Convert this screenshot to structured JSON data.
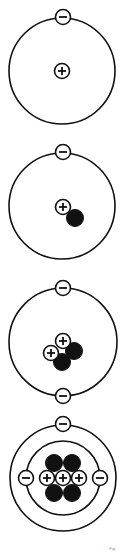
{
  "diagram": {
    "title": "",
    "colors": {
      "stroke": "#111111",
      "background": "#ffffff",
      "neutron": "#111111"
    },
    "particle_radius": 7.5,
    "neutron_radius": 8.5,
    "atoms": [
      {
        "name": "atom-1",
        "orbits": [
          {
            "cx": 62,
            "cy": 71,
            "r": 53
          }
        ],
        "electrons": [
          {
            "cx": 63,
            "cy": 17
          }
        ],
        "neutrons": [],
        "protons": [
          {
            "cx": 62,
            "cy": 71
          }
        ]
      },
      {
        "name": "atom-2",
        "orbits": [
          {
            "cx": 62,
            "cy": 206,
            "r": 53
          }
        ],
        "electrons": [
          {
            "cx": 63,
            "cy": 152
          }
        ],
        "neutrons": [
          {
            "cx": 75,
            "cy": 218
          }
        ],
        "protons": [
          {
            "cx": 63,
            "cy": 207
          }
        ]
      },
      {
        "name": "atom-3",
        "orbits": [
          {
            "cx": 63,
            "cy": 342,
            "r": 54
          }
        ],
        "electrons": [
          {
            "cx": 63,
            "cy": 288
          },
          {
            "cx": 63,
            "cy": 396
          }
        ],
        "neutrons": [
          {
            "cx": 74,
            "cy": 351
          },
          {
            "cx": 62,
            "cy": 362
          }
        ],
        "protons": [
          {
            "cx": 63,
            "cy": 341
          },
          {
            "cx": 51,
            "cy": 353
          }
        ]
      },
      {
        "name": "atom-4",
        "orbits": [
          {
            "cx": 63,
            "cy": 478,
            "r": 53
          },
          {
            "cx": 63,
            "cy": 478,
            "r": 37
          }
        ],
        "electrons": [
          {
            "cx": 63,
            "cy": 424
          },
          {
            "cx": 26,
            "cy": 478
          },
          {
            "cx": 100,
            "cy": 478
          }
        ],
        "neutrons": [
          {
            "cx": 54,
            "cy": 463
          },
          {
            "cx": 72,
            "cy": 463
          },
          {
            "cx": 54,
            "cy": 493
          },
          {
            "cx": 72,
            "cy": 493
          }
        ],
        "protons": [
          {
            "cx": 47,
            "cy": 478
          },
          {
            "cx": 63,
            "cy": 478
          },
          {
            "cx": 79,
            "cy": 478
          }
        ]
      }
    ],
    "caption": "Fig."
  }
}
